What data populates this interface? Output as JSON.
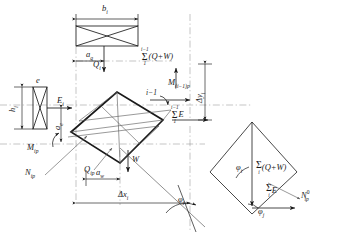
{
  "figure": {
    "type": "engineering-force-diagram",
    "title": "",
    "stroke_color": "#1a1a1a",
    "thin_color": "#555555",
    "centerline_color": "#888888"
  },
  "left_diagram": {
    "name": "slice-free-body-diagram",
    "labels": {
      "b_i": "b",
      "b_i_sub": "i",
      "a_q": "a",
      "a_q_sub": "q",
      "Q_i": "Q",
      "Q_i_sub": "i",
      "e": "e",
      "h_i": "h",
      "h_i_sub": "i",
      "E_i": "E",
      "E_i_sub": "i",
      "a_e": "a",
      "a_e_sub": "e",
      "M_ip": "M",
      "M_ip_sub": "ip",
      "N_ip": "N",
      "N_ip_sub": "ip",
      "Q_ip": "Q",
      "Q_ip_sub": "ip",
      "W": "W",
      "a_w": "a",
      "a_w_sub": "w",
      "dx_i": "Δx",
      "dx_i_sub": "i",
      "dy_i": "Δy",
      "dy_i_sub": "i",
      "phi_i": "φ",
      "phi_i_sub": "i",
      "node_i_minus_1": "i−1",
      "M_i1p": "M",
      "M_i1p_sub": "(i−1)p",
      "sum_QW_big": "Σ",
      "sum_QW_top": "i−1",
      "sum_QW_bot": "1",
      "sum_QW_arg": "(Q+W)",
      "sum_E_big": "Σ",
      "sum_E_top": "i−1",
      "sum_E_bot": "1",
      "sum_E_arg": "E"
    }
  },
  "right_diagram": {
    "name": "force-polygon-diagram",
    "labels": {
      "phi_i": "φ",
      "phi_i_sub": "i",
      "phi_j": "φ",
      "phi_j_sub": "j",
      "N0_ip": "N",
      "N0_ip_sub": "ip",
      "N0_ip_sup": "0",
      "sum_QW_big": "Σ",
      "sum_QW_top": "i",
      "sum_QW_arg": "(Q+W)",
      "sum_E_big": "Σ",
      "sum_E_top": "i",
      "sum_E_arg": "E"
    }
  }
}
